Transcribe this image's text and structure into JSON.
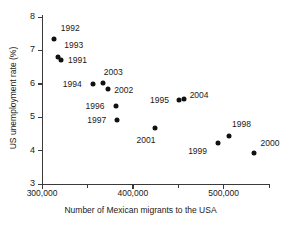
{
  "chart_data": {
    "type": "scatter",
    "title": "",
    "xlabel": "Number of Mexican migrants to the USA",
    "ylabel": "US unemployment rate (%)",
    "xlim": [
      300000,
      550000
    ],
    "ylim": [
      3,
      8
    ],
    "grid": false,
    "legend": false,
    "x_ticks": [
      {
        "value": 300000,
        "label": "300,000",
        "major": true
      },
      {
        "value": 350000,
        "label": "",
        "major": false
      },
      {
        "value": 400000,
        "label": "400,000",
        "major": true
      },
      {
        "value": 450000,
        "label": "",
        "major": false
      },
      {
        "value": 500000,
        "label": "500,000",
        "major": true
      },
      {
        "value": 550000,
        "label": "",
        "major": false
      }
    ],
    "y_ticks": [
      {
        "value": 8,
        "label": "8"
      },
      {
        "value": 7,
        "label": "7"
      },
      {
        "value": 6,
        "label": "6"
      },
      {
        "value": 5,
        "label": "5"
      },
      {
        "value": 4,
        "label": "4"
      },
      {
        "value": 3,
        "label": "3"
      }
    ],
    "points": [
      {
        "label": "1992",
        "x": 313000,
        "y": 7.35,
        "label_dx": 7,
        "label_dy": -11
      },
      {
        "label": "1993",
        "x": 318000,
        "y": 6.8,
        "label_dx": 6,
        "label_dy": -12
      },
      {
        "label": "1991",
        "x": 321000,
        "y": 6.7,
        "label_dx": 7,
        "label_dy": 0
      },
      {
        "label": "1994",
        "x": 356000,
        "y": 5.98,
        "label_dx": -30,
        "label_dy": 0
      },
      {
        "label": "2003",
        "x": 367000,
        "y": 6.02,
        "label_dx": 1,
        "label_dy": -11
      },
      {
        "label": "2002",
        "x": 373000,
        "y": 5.85,
        "label_dx": 6,
        "label_dy": 1
      },
      {
        "label": "1996",
        "x": 381000,
        "y": 5.33,
        "label_dx": -30,
        "label_dy": 0
      },
      {
        "label": "1997",
        "x": 383000,
        "y": 4.93,
        "label_dx": -30,
        "label_dy": 0
      },
      {
        "label": "2001",
        "x": 424000,
        "y": 4.68,
        "label_dx": -18,
        "label_dy": 12
      },
      {
        "label": "1995",
        "x": 451000,
        "y": 5.52,
        "label_dx": -29,
        "label_dy": 0
      },
      {
        "label": "2004",
        "x": 456000,
        "y": 5.55,
        "label_dx": 6,
        "label_dy": -4
      },
      {
        "label": "1999",
        "x": 494000,
        "y": 4.22,
        "label_dx": -30,
        "label_dy": 8
      },
      {
        "label": "1998",
        "x": 506000,
        "y": 4.44,
        "label_dx": 3,
        "label_dy": -12
      },
      {
        "label": "2000",
        "x": 534000,
        "y": 3.92,
        "label_dx": 6,
        "label_dy": -10
      }
    ]
  }
}
